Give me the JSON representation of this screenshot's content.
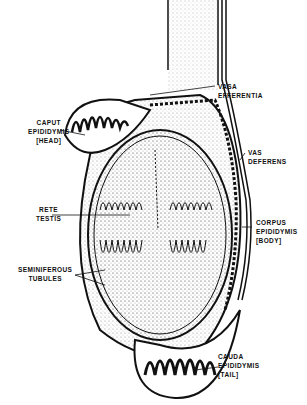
{
  "diagram": {
    "type": "anatomical-illustration",
    "labels": {
      "caput": [
        "CAPUT",
        "EPIDIDYMIS",
        "[HEAD]"
      ],
      "rete": [
        "RETE",
        "TESTIS"
      ],
      "seminiferous": [
        "SEMINIFEROUS",
        "TUBULES"
      ],
      "vasa": [
        "VASA",
        "EFFERENTIA"
      ],
      "vas": [
        "VAS",
        "DEFERENS"
      ],
      "corpus": [
        "CORPUS",
        "EPIDIDYMIS",
        "[BODY]"
      ],
      "cauda": [
        "CAUDA",
        "EPIDIDYMIS",
        "[TAIL]"
      ]
    },
    "colors": {
      "ink": "#111111",
      "background": "#ffffff",
      "stipple": "#bbbbbb"
    }
  }
}
